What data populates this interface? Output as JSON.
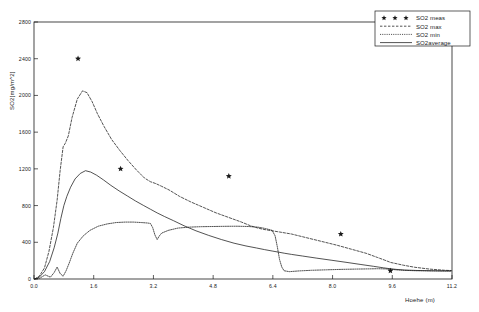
{
  "chart_data": {
    "type": "line",
    "title": "",
    "xlabel": "Hoehe  (m)",
    "ylabel": "SO2[mg/m^2]",
    "xlim": [
      0.0,
      11.2
    ],
    "ylim": [
      0,
      2800
    ],
    "xticks": [
      "0.0",
      "1.6",
      "3.2",
      "4.8",
      "6.4",
      "8.0",
      "9.6",
      "11.2"
    ],
    "xtick_values": [
      0.0,
      1.6,
      3.2,
      4.8,
      6.4,
      8.0,
      9.6,
      11.2
    ],
    "yticks": [
      "0",
      "400",
      "800",
      "1200",
      "1600",
      "2000",
      "2400",
      "2800"
    ],
    "ytick_values": [
      0,
      400,
      800,
      1200,
      1600,
      2000,
      2400,
      2800
    ],
    "grid": false,
    "legend_position": "top-right",
    "series": [
      {
        "name": "SO2  meas",
        "style": "scatter",
        "marker": "star",
        "points": [
          {
            "x": 1.18,
            "y": 2400
          },
          {
            "x": 2.32,
            "y": 1200
          },
          {
            "x": 5.22,
            "y": 1120
          },
          {
            "x": 8.22,
            "y": 490
          },
          {
            "x": 9.55,
            "y": 90
          }
        ]
      },
      {
        "name": "SO2  max",
        "style": "dashed",
        "x": [
          0.02,
          0.14,
          0.28,
          0.4,
          0.52,
          0.62,
          0.7,
          0.78,
          0.84,
          0.92,
          1.02,
          1.16,
          1.3,
          1.42,
          1.56,
          1.7,
          1.88,
          2.08,
          2.3,
          2.52,
          2.74,
          2.96,
          3.12,
          3.26,
          3.42,
          3.62,
          3.9,
          4.2,
          4.54,
          4.88,
          5.22,
          5.56,
          5.8,
          6.0,
          6.16,
          6.34,
          6.58,
          6.9,
          7.3,
          7.7,
          8.1,
          8.5,
          8.9,
          9.2,
          9.4,
          9.56,
          9.7,
          9.9,
          10.2,
          10.6,
          11.0,
          11.18
        ],
        "y": [
          0,
          30,
          120,
          300,
          560,
          860,
          1180,
          1440,
          1480,
          1560,
          1760,
          1960,
          2050,
          2030,
          1930,
          1800,
          1660,
          1520,
          1400,
          1290,
          1190,
          1100,
          1060,
          1040,
          1010,
          970,
          900,
          840,
          780,
          720,
          670,
          620,
          580,
          555,
          540,
          528,
          512,
          490,
          450,
          410,
          370,
          325,
          280,
          235,
          205,
          180,
          168,
          150,
          128,
          108,
          95,
          92
        ]
      },
      {
        "name": "SO2  min",
        "style": "dotted",
        "x": [
          0.02,
          0.16,
          0.3,
          0.44,
          0.54,
          0.62,
          0.7,
          0.78,
          0.86,
          0.94,
          1.04,
          1.16,
          1.32,
          1.5,
          1.72,
          1.96,
          2.2,
          2.44,
          2.66,
          2.88,
          3.04,
          3.12,
          3.18,
          3.24,
          3.3,
          3.36,
          3.42,
          3.6,
          3.86,
          4.16,
          4.48,
          4.8,
          5.12,
          5.44,
          5.74,
          6.0,
          6.2,
          6.38,
          6.46,
          6.52,
          6.58,
          6.64,
          6.7,
          6.84,
          7.1,
          7.44,
          7.84,
          8.24,
          8.62,
          8.94,
          9.2,
          9.42,
          9.56,
          9.7,
          9.92,
          10.24,
          10.64,
          11.04,
          11.18
        ],
        "y": [
          0,
          10,
          45,
          20,
          70,
          130,
          60,
          30,
          90,
          170,
          280,
          390,
          470,
          530,
          575,
          600,
          615,
          620,
          620,
          615,
          610,
          605,
          560,
          480,
          430,
          470,
          500,
          530,
          555,
          565,
          570,
          572,
          574,
          575,
          572,
          565,
          550,
          530,
          470,
          350,
          210,
          130,
          90,
          80,
          88,
          95,
          100,
          105,
          108,
          110,
          112,
          110,
          106,
          100,
          94,
          90,
          88,
          87,
          87
        ]
      },
      {
        "name": "SO2average",
        "style": "solid",
        "x": [
          0.02,
          0.14,
          0.28,
          0.42,
          0.54,
          0.64,
          0.72,
          0.8,
          0.88,
          0.98,
          1.1,
          1.24,
          1.38,
          1.52,
          1.68,
          1.86,
          2.06,
          2.28,
          2.5,
          2.72,
          2.94,
          3.12,
          3.3,
          3.5,
          3.74,
          4.02,
          4.34,
          4.68,
          5.02,
          5.36,
          5.68,
          5.96,
          6.18,
          6.38,
          6.56,
          6.72,
          6.9,
          7.2,
          7.56,
          7.96,
          8.36,
          8.76,
          9.1,
          9.36,
          9.54,
          9.7,
          9.92,
          10.26,
          10.64,
          11.0,
          11.18
        ],
        "y": [
          0,
          20,
          80,
          190,
          340,
          500,
          660,
          800,
          900,
          1000,
          1090,
          1150,
          1180,
          1165,
          1130,
          1080,
          1020,
          960,
          905,
          850,
          800,
          760,
          720,
          680,
          635,
          580,
          525,
          475,
          430,
          390,
          360,
          338,
          320,
          305,
          292,
          280,
          268,
          250,
          228,
          205,
          182,
          158,
          138,
          122,
          112,
          105,
          98,
          93,
          90,
          88,
          88
        ]
      }
    ],
    "legend_entries": [
      {
        "label": "SO2  meas",
        "style": "stars"
      },
      {
        "label": "SO2  max",
        "style": "dashed"
      },
      {
        "label": "SO2  min",
        "style": "dotted"
      },
      {
        "label": "SO2average",
        "style": "solid"
      }
    ]
  }
}
